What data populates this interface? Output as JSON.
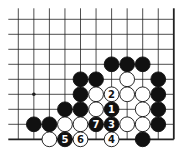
{
  "board": {
    "description": "Go problem diagram, lower-right corner region",
    "columns": 11,
    "rows": 9,
    "origin_x": 18.3,
    "origin_y": 19.3,
    "spacing_x": 15.55,
    "spacing_y": 15.0,
    "edges": {
      "right": true,
      "bottom": true,
      "left": false,
      "top": false
    },
    "line_color": "#222222",
    "background": "#ffffff",
    "hoshi": [
      {
        "col": 1,
        "row": 5
      }
    ]
  },
  "stones": [
    {
      "col": 6,
      "row": 3,
      "color": "black",
      "label": ""
    },
    {
      "col": 7,
      "row": 3,
      "color": "black",
      "label": ""
    },
    {
      "col": 8,
      "row": 3,
      "color": "black",
      "label": ""
    },
    {
      "col": 4,
      "row": 4,
      "color": "black",
      "label": ""
    },
    {
      "col": 5,
      "row": 4,
      "color": "black",
      "label": ""
    },
    {
      "col": 7,
      "row": 4,
      "color": "white",
      "label": ""
    },
    {
      "col": 9,
      "row": 4,
      "color": "black",
      "label": ""
    },
    {
      "col": 4,
      "row": 5,
      "color": "black",
      "label": ""
    },
    {
      "col": 5,
      "row": 5,
      "color": "white",
      "label": ""
    },
    {
      "col": 6,
      "row": 5,
      "color": "white",
      "label": "2"
    },
    {
      "col": 7,
      "row": 5,
      "color": "white",
      "label": ""
    },
    {
      "col": 8,
      "row": 5,
      "color": "white",
      "label": ""
    },
    {
      "col": 9,
      "row": 5,
      "color": "black",
      "label": ""
    },
    {
      "col": 3,
      "row": 6,
      "color": "black",
      "label": ""
    },
    {
      "col": 4,
      "row": 6,
      "color": "black",
      "label": ""
    },
    {
      "col": 5,
      "row": 6,
      "color": "white",
      "label": ""
    },
    {
      "col": 6,
      "row": 6,
      "color": "black",
      "label": "1"
    },
    {
      "col": 8,
      "row": 6,
      "color": "white",
      "label": ""
    },
    {
      "col": 9,
      "row": 6,
      "color": "black",
      "label": ""
    },
    {
      "col": 1,
      "row": 7,
      "color": "black",
      "label": ""
    },
    {
      "col": 2,
      "row": 7,
      "color": "black",
      "label": ""
    },
    {
      "col": 3,
      "row": 7,
      "color": "white",
      "label": ""
    },
    {
      "col": 4,
      "row": 7,
      "color": "white",
      "label": ""
    },
    {
      "col": 5,
      "row": 7,
      "color": "black",
      "label": "7"
    },
    {
      "col": 6,
      "row": 7,
      "color": "black",
      "label": "3"
    },
    {
      "col": 7,
      "row": 7,
      "color": "white",
      "label": ""
    },
    {
      "col": 8,
      "row": 7,
      "color": "white",
      "label": ""
    },
    {
      "col": 9,
      "row": 7,
      "color": "black",
      "label": ""
    },
    {
      "col": 2,
      "row": 8,
      "color": "white",
      "label": ""
    },
    {
      "col": 3,
      "row": 8,
      "color": "black",
      "label": "5"
    },
    {
      "col": 4,
      "row": 8,
      "color": "white",
      "label": "6"
    },
    {
      "col": 6,
      "row": 8,
      "color": "white",
      "label": "4"
    },
    {
      "col": 8,
      "row": 8,
      "color": "black",
      "label": ""
    }
  ],
  "move_sequence": [
    {
      "move": "1",
      "color": "black",
      "col": 6,
      "row": 6
    },
    {
      "move": "2",
      "color": "white",
      "col": 6,
      "row": 5
    },
    {
      "move": "3",
      "color": "black",
      "col": 6,
      "row": 7
    },
    {
      "move": "4",
      "color": "white",
      "col": 6,
      "row": 8
    },
    {
      "move": "5",
      "color": "black",
      "col": 3,
      "row": 8
    },
    {
      "move": "6",
      "color": "white",
      "col": 4,
      "row": 8
    },
    {
      "move": "7",
      "color": "black",
      "col": 5,
      "row": 7
    }
  ]
}
